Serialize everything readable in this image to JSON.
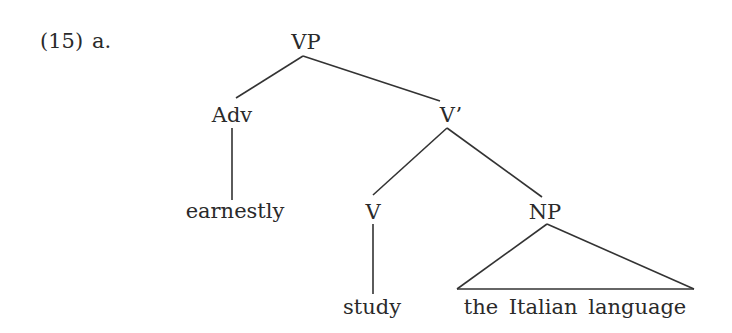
{
  "example": {
    "number": "(15)",
    "letter": "a."
  },
  "tree": {
    "nodes": {
      "vp": "VP",
      "adv": "Adv",
      "vbar": "V’",
      "v": "V",
      "np": "NP"
    },
    "leaves": {
      "adv": "earnestly",
      "v": "study",
      "np": "the Italian language"
    },
    "edges": [
      [
        "VP",
        "Adv"
      ],
      [
        "VP",
        "V’"
      ],
      [
        "Adv",
        "earnestly"
      ],
      [
        "V’",
        "V"
      ],
      [
        "V’",
        "NP"
      ],
      [
        "V",
        "study"
      ],
      [
        "NP",
        "the Italian language (triangle)"
      ]
    ]
  }
}
